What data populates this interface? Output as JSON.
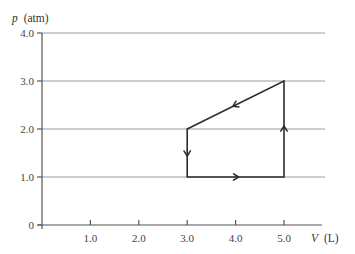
{
  "chart_data": {
    "type": "line",
    "title": "",
    "xlabel": {
      "symbol": "V",
      "unit": "(L)"
    },
    "ylabel": {
      "symbol": "p",
      "unit": "(atm)"
    },
    "xlim": [
      0,
      6.0
    ],
    "ylim": [
      0,
      4.0
    ],
    "x_ticks": [
      1.0,
      2.0,
      3.0,
      4.0,
      5.0
    ],
    "x_tick_labels": [
      "1.0",
      "2.0",
      "3.0",
      "4.0",
      "5.0"
    ],
    "y_ticks": [
      0,
      1.0,
      2.0,
      3.0,
      4.0
    ],
    "y_tick_labels": [
      "0",
      "1.0",
      "2.0",
      "3.0",
      "4.0"
    ],
    "grid": {
      "horizontal": true,
      "vertical": false
    },
    "series": [
      {
        "name": "thermodynamic cycle",
        "closed": true,
        "points": [
          {
            "V": 3.0,
            "p": 1.0
          },
          {
            "V": 5.0,
            "p": 1.0
          },
          {
            "V": 5.0,
            "p": 3.0
          },
          {
            "V": 3.0,
            "p": 2.0
          }
        ],
        "direction_arrows": [
          {
            "from": [
              3.0,
              1.0
            ],
            "to": [
              5.0,
              1.0
            ],
            "at": 0.5,
            "label": "right"
          },
          {
            "from": [
              5.0,
              1.0
            ],
            "to": [
              5.0,
              3.0
            ],
            "at": 0.5,
            "label": "up"
          },
          {
            "from": [
              5.0,
              3.0
            ],
            "to": [
              3.0,
              2.0
            ],
            "at": 0.5,
            "label": "down-left"
          },
          {
            "from": [
              3.0,
              2.0
            ],
            "to": [
              3.0,
              1.0
            ],
            "at": 0.5,
            "label": "down"
          }
        ]
      }
    ]
  }
}
